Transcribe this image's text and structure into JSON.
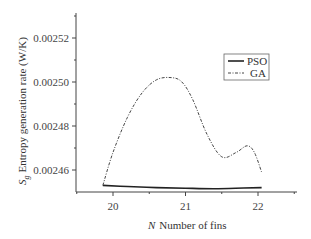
{
  "chart_data": {
    "type": "line",
    "title": "",
    "xlabel": "N Number of fins",
    "xlabel_symbol": "N",
    "xlabel_text": "Number of fins",
    "ylabel": "S_g Entropy generation rate (W/K)",
    "ylabel_symbol": "S",
    "ylabel_subscript": "g",
    "ylabel_text": "Entropy generation rate (W/K)",
    "xlim": [
      19.5,
      22.5
    ],
    "ylim": [
      0.00245,
      0.00253
    ],
    "x_ticks": [
      "20",
      "21",
      "22"
    ],
    "y_ticks": [
      "0.00246",
      "0.00248",
      "0.00250",
      "0.00252"
    ],
    "grid": false,
    "legend_position": "upper right",
    "series": [
      {
        "name": "PSO",
        "style": "solid",
        "x": [
          19.86,
          20.2,
          20.6,
          21.0,
          21.4,
          21.8,
          22.05
        ],
        "y": [
          0.002453,
          0.0024525,
          0.002452,
          0.0024517,
          0.0024515,
          0.0024518,
          0.002452
        ]
      },
      {
        "name": "GA",
        "style": "dash-dot",
        "x": [
          19.86,
          20.0,
          20.2,
          20.4,
          20.6,
          20.8,
          20.95,
          21.1,
          21.3,
          21.5,
          21.7,
          21.85,
          21.95,
          22.05
        ],
        "y": [
          0.002453,
          0.002468,
          0.002484,
          0.002495,
          0.002501,
          0.002502,
          0.0025,
          0.002492,
          0.002476,
          0.002466,
          0.002468,
          0.002471,
          0.002468,
          0.002459
        ]
      }
    ]
  },
  "legend": {
    "items": [
      {
        "label": "PSO"
      },
      {
        "label": "GA"
      }
    ]
  }
}
